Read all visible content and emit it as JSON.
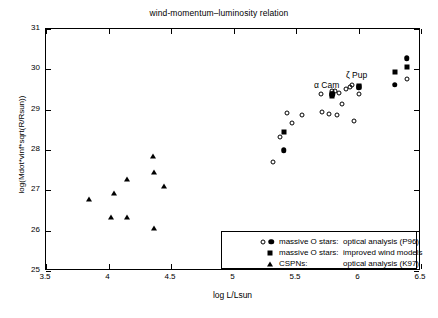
{
  "chart_data": {
    "type": "scatter",
    "title": "wind-momentum–luminosity relation",
    "xlabel": "log L/Lsun",
    "ylabel": "log(Mdot*vinf*sqrt(R/Rsun))",
    "xlim": [
      3.5,
      6.5
    ],
    "ylim": [
      25,
      31
    ],
    "xticks": [
      "3.5",
      "4",
      "4.5",
      "5",
      "5.5",
      "6",
      "6.5"
    ],
    "xtick_values": [
      3.5,
      4.0,
      4.5,
      5.0,
      5.5,
      6.0,
      6.5
    ],
    "yticks": [
      "25",
      "26",
      "27",
      "28",
      "29",
      "30",
      "31"
    ],
    "ytick_values": [
      25,
      26,
      27,
      28,
      29,
      30,
      31
    ],
    "grid": false,
    "legend_position": "lower right",
    "series": [
      {
        "name": "massive O stars: optical analysis (P96)",
        "marker": "open-circle",
        "points": [
          [
            5.315,
            27.7
          ],
          [
            5.375,
            28.33
          ],
          [
            5.425,
            28.92
          ],
          [
            5.47,
            28.67
          ],
          [
            5.545,
            28.86
          ],
          [
            5.7,
            29.39
          ],
          [
            5.71,
            28.93
          ],
          [
            5.76,
            28.9
          ],
          [
            5.79,
            29.46
          ],
          [
            5.815,
            29.47
          ],
          [
            5.83,
            28.88
          ],
          [
            5.845,
            29.41
          ],
          [
            5.865,
            29.15
          ],
          [
            5.9,
            29.52
          ],
          [
            5.93,
            29.56
          ],
          [
            5.95,
            29.62
          ],
          [
            5.965,
            28.71
          ],
          [
            6.0,
            29.39
          ],
          [
            6.385,
            29.76
          ]
        ]
      },
      {
        "name": "massive O stars: filled (P96)",
        "marker": "filled-circle",
        "points": [
          [
            5.4,
            27.99
          ],
          [
            5.79,
            29.38
          ],
          [
            6.0,
            29.56
          ],
          [
            6.29,
            29.62
          ],
          [
            6.385,
            30.27
          ]
        ]
      },
      {
        "name": "massive O stars: improved wind models",
        "marker": "filled-square",
        "points": [
          [
            5.4,
            28.45
          ],
          [
            5.785,
            29.4
          ],
          [
            5.79,
            29.34
          ],
          [
            6.0,
            29.58
          ],
          [
            6.005,
            29.55
          ],
          [
            6.29,
            29.93
          ],
          [
            6.385,
            30.07
          ]
        ]
      },
      {
        "name": "CSPNs: optical analysis (K97)",
        "marker": "filled-triangle",
        "points": [
          [
            3.84,
            26.78
          ],
          [
            4.02,
            26.35
          ],
          [
            4.045,
            26.93
          ],
          [
            4.145,
            27.28
          ],
          [
            4.15,
            26.34
          ],
          [
            4.355,
            27.84
          ],
          [
            4.36,
            26.07
          ],
          [
            4.36,
            27.46
          ],
          [
            4.44,
            27.11
          ]
        ]
      }
    ],
    "annotations": [
      {
        "text": "α Cam",
        "x": 5.745,
        "y": 29.62
      },
      {
        "text": "ζ Pup",
        "x": 5.985,
        "y": 29.87
      }
    ]
  },
  "legend": {
    "rows": [
      {
        "symbols": [
          "open-circle",
          "filled-circle"
        ],
        "label": "massive O stars:",
        "desc": "optical analysis (P96)"
      },
      {
        "symbols": [
          "filled-square"
        ],
        "label": "massive O stars:",
        "desc": "improved wind models"
      },
      {
        "symbols": [
          "filled-triangle"
        ],
        "label": "CSPNs:",
        "desc": "optical analysis (K97)"
      }
    ]
  }
}
